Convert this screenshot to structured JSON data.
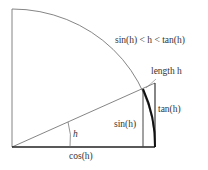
{
  "diagram": {
    "type": "unit-circle-sector",
    "labels": {
      "inequality": "sin(h) < h < tan(h)",
      "arc_length": "length h",
      "tan": "tan(h)",
      "sin": "sin(h)",
      "angle": "h",
      "cos": "cos(h)"
    },
    "colors": {
      "line": "#555555",
      "bold": "#111111",
      "text": "#333333"
    }
  }
}
